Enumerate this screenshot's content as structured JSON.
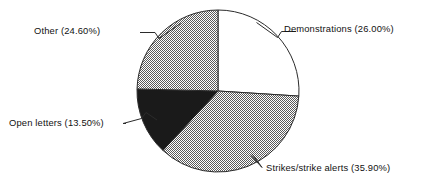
{
  "chart_data": {
    "type": "pie",
    "title": "",
    "subtitle": "",
    "xlabel": "",
    "ylabel": "",
    "legend_position": "none",
    "labels_position": "outside-with-leader-lines",
    "grid": false,
    "start_angle_deg": 0,
    "direction": "clockwise",
    "categories": [
      "Demonstrations",
      "Strikes/strike alerts",
      "Open letters",
      "Other"
    ],
    "values": [
      26.0,
      35.9,
      13.5,
      24.6
    ],
    "value_unit": "%",
    "slices": [
      {
        "name": "Demonstrations",
        "value": 26.0,
        "label": "Demonstrations (26.00%)",
        "percent_text": "26.00%",
        "fill": "white",
        "fill_color": "#ffffff",
        "start_angle_deg": 0.0,
        "end_angle_deg": 93.6
      },
      {
        "name": "Strikes/strike alerts",
        "value": 35.9,
        "label": "Strikes/strike alerts (35.90%)",
        "percent_text": "35.90%",
        "fill": "gray-dither",
        "fill_color": "#b3b3b3",
        "start_angle_deg": 93.6,
        "end_angle_deg": 222.84
      },
      {
        "name": "Open letters",
        "value": 13.5,
        "label": "Open letters (13.50%)",
        "percent_text": "13.50%",
        "fill": "solid-black",
        "fill_color": "#1a1a1a",
        "start_angle_deg": 222.84,
        "end_angle_deg": 271.44
      },
      {
        "name": "Other",
        "value": 24.6,
        "label": "Other (24.60%)",
        "percent_text": "24.60%",
        "fill": "gray-dither",
        "fill_color": "#b3b3b3",
        "start_angle_deg": 271.44,
        "end_angle_deg": 360.0
      }
    ]
  },
  "colors": {
    "background": "#ffffff",
    "outline": "#2b2b2b",
    "text": "#111111",
    "hatch_gray": "#b3b3b3",
    "solid_black": "#1a1a1a"
  },
  "labels": {
    "demonstrations": "Demonstrations (26.00%)",
    "strikes": "Strikes/strike alerts (35.90%)",
    "open_letters": "Open letters (13.50%)",
    "other": "Other (24.60%)"
  }
}
